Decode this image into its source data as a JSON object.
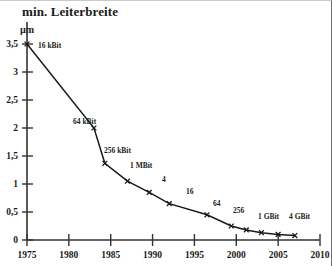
{
  "chart_data": {
    "type": "line",
    "title": "min. Leiterbreite",
    "ylabel": "µm",
    "xlabel": "",
    "xlim": [
      1975,
      2010
    ],
    "ylim": [
      0,
      3.5
    ],
    "grid": false,
    "legend": "none",
    "marker": "x",
    "xticks": [
      "1975",
      "1980",
      "1985",
      "1990",
      "1995",
      "2000",
      "2005",
      "2010"
    ],
    "xtick_values": [
      1975,
      1980,
      1985,
      1990,
      1995,
      2000,
      2005,
      2010
    ],
    "yticks": [
      "0",
      "0,5",
      "1",
      "1,5",
      "2",
      "2,5",
      "3",
      "3,5"
    ],
    "ytick_values": [
      0,
      0.5,
      1,
      1.5,
      2,
      2.5,
      3,
      3.5
    ],
    "x": [
      1975,
      1983,
      1984.3,
      1987,
      1989.6,
      1992,
      1996.5,
      1999.4,
      2001.2,
      2003,
      2005,
      2007
    ],
    "values": [
      3.5,
      2.0,
      1.37,
      1.05,
      0.85,
      0.65,
      0.45,
      0.25,
      0.18,
      0.13,
      0.1,
      0.08
    ],
    "point_labels": [
      "16 kBit",
      "64 kBit",
      "256 kBit",
      "1 MBit",
      "4",
      "16",
      "64",
      "256",
      "",
      "1 GBit",
      "",
      "4 GBit"
    ],
    "annotations": [
      {
        "text": "16 kBit",
        "x": 38,
        "y": 48
      },
      {
        "text": "64 kBit",
        "x": 73,
        "y": 124
      },
      {
        "text": "256 kBit",
        "x": 104,
        "y": 153
      },
      {
        "text": "1 MBit",
        "x": 130,
        "y": 168
      },
      {
        "text": "4",
        "x": 162,
        "y": 182
      },
      {
        "text": "16",
        "x": 186,
        "y": 194
      },
      {
        "text": "64",
        "x": 213,
        "y": 206
      },
      {
        "text": "256",
        "x": 233,
        "y": 213
      },
      {
        "text": "1 GBit",
        "x": 258,
        "y": 219
      },
      {
        "text": "4 GBit",
        "x": 289,
        "y": 219
      }
    ],
    "line_color": "#1a1a1a",
    "axis_color": "#333333",
    "background_color": "#ffffff"
  }
}
